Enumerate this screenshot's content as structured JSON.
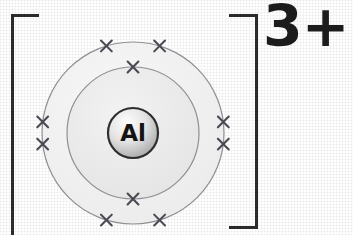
{
  "diagram": {
    "type": "dot-and-cross-ion-diagram",
    "species": "aluminium ion",
    "nucleus_symbol": "Al",
    "charge_label": "3+",
    "bracket_style": "square",
    "electron_marker": "cross",
    "colors": {
      "background": "#ffffff",
      "bracket": "#2b2b2b",
      "charge_text": "#1c1c1c",
      "shell_stroke": "#8e8e94",
      "shell_fill_outer": "#f2f2f2",
      "shell_fill_inner": "#ececec",
      "nucleus_stroke": "#2e2e2e",
      "nucleus_fill_light": "#fbfbfb",
      "nucleus_fill_dark": "#a8a8a8",
      "nucleus_text": "#141414",
      "electron_cross": "#4a4a52"
    },
    "center": {
      "x": 133,
      "y": 133
    },
    "shells": [
      {
        "name": "outer-shell",
        "index": 2,
        "radius": 91,
        "electron_count": 8,
        "electron_angles_deg": [
          253,
          287,
          173,
          187,
          353,
          7,
          73,
          107
        ]
      },
      {
        "name": "inner-shell",
        "index": 1,
        "radius": 66,
        "electron_count": 2,
        "electron_angles_deg": [
          270,
          90
        ]
      }
    ],
    "nucleus": {
      "name": "nucleus",
      "radius": 25
    }
  }
}
